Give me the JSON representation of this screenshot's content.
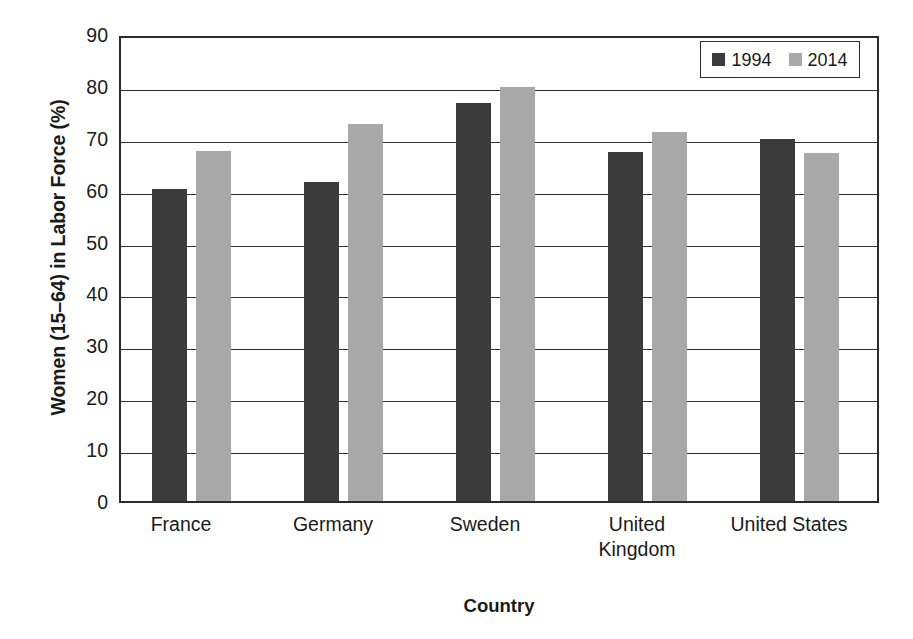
{
  "chart_data": {
    "type": "bar",
    "title": "",
    "xlabel": "Country",
    "ylabel": "Women (15–64) in Labor Force (%)",
    "categories": [
      "France",
      "Germany",
      "Sweden",
      "United Kingdom",
      "United States"
    ],
    "category_labels": [
      [
        "France"
      ],
      [
        "Germany"
      ],
      [
        "Sweden"
      ],
      [
        "United",
        "Kingdom"
      ],
      [
        "United States"
      ]
    ],
    "series": [
      {
        "name": "1994",
        "color": "#3b3b3b",
        "values": [
          60.2,
          61.4,
          76.7,
          67.3,
          69.7
        ]
      },
      {
        "name": "2014",
        "color": "#a9a9a9",
        "values": [
          67.4,
          72.7,
          79.7,
          71.2,
          67.0
        ]
      }
    ],
    "ylim": [
      0,
      90
    ],
    "ytick_step": 10,
    "yticks": [
      90,
      80,
      70,
      60,
      50,
      40,
      30,
      20,
      10,
      0
    ],
    "ytick_labels": [
      "90",
      "80",
      "70",
      "60",
      "50",
      "40",
      "30",
      "20",
      "10",
      "0"
    ],
    "grid": true,
    "grid_axis": "y",
    "legend_position": "top-right",
    "legend_entries": [
      "1994",
      "2014"
    ]
  }
}
